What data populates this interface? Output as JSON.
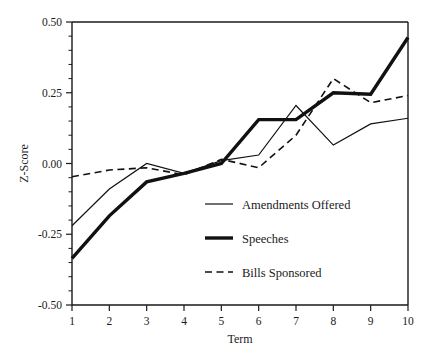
{
  "chart_data": {
    "type": "line",
    "title": "",
    "xlabel": "Term",
    "ylabel": "Z-Score",
    "x": [
      1,
      2,
      3,
      4,
      5,
      6,
      7,
      8,
      9,
      10
    ],
    "xlim": [
      1,
      10
    ],
    "ylim": [
      -0.5,
      0.5
    ],
    "xtick_labels": [
      "1",
      "2",
      "3",
      "4",
      "5",
      "6",
      "7",
      "8",
      "9",
      "10"
    ],
    "ytick_labels": [
      "0.50",
      "0.25",
      "0.00",
      "-0.25",
      "-0.50"
    ],
    "ytick_values": [
      0.5,
      0.25,
      0.0,
      -0.25,
      -0.5
    ],
    "yminor_step": 0.05,
    "grid": false,
    "legend_position": "center-right-inside",
    "series": [
      {
        "name": "Amendments Offered",
        "style": "thin-solid",
        "color": "#111111",
        "values": [
          -0.22,
          -0.09,
          0.0,
          -0.035,
          0.01,
          0.03,
          0.205,
          0.065,
          0.14,
          0.16
        ]
      },
      {
        "name": "Speeches",
        "style": "thick-solid",
        "color": "#111111",
        "values": [
          -0.335,
          -0.185,
          -0.065,
          -0.035,
          0.0,
          0.155,
          0.155,
          0.25,
          0.245,
          0.445
        ]
      },
      {
        "name": "Bills Sponsored",
        "style": "dashed",
        "color": "#111111",
        "values": [
          -0.047,
          -0.023,
          -0.015,
          -0.04,
          0.015,
          -0.015,
          0.1,
          0.3,
          0.215,
          0.24
        ]
      }
    ]
  },
  "legend": {
    "items": [
      {
        "label": "Amendments Offered",
        "style": "thin-solid"
      },
      {
        "label": "Speeches",
        "style": "thick-solid"
      },
      {
        "label": "Bills Sponsored",
        "style": "dashed"
      }
    ]
  },
  "axes": {
    "y_title": "Z-Score",
    "x_title": "Term"
  }
}
